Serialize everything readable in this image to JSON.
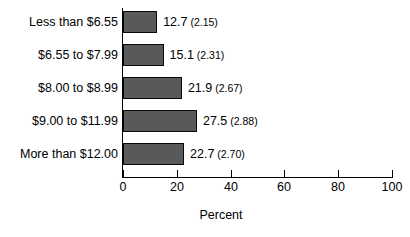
{
  "chart_data": {
    "type": "bar",
    "orientation": "horizontal",
    "title": "",
    "xlabel": "Percent",
    "ylabel": "",
    "xlim": [
      0,
      100
    ],
    "xticks": [
      "0",
      "20",
      "40",
      "60",
      "80",
      "100"
    ],
    "grid": false,
    "legend": null,
    "categories": [
      "Less than $6.55",
      "$6.55 to $7.99",
      "$8.00 to $8.99",
      "$9.00 to $11.99",
      "More than $12.00"
    ],
    "values": [
      12.7,
      15.1,
      21.9,
      27.5,
      22.7
    ],
    "standard_errors": [
      2.15,
      2.31,
      2.67,
      2.88,
      2.7
    ],
    "data_labels": [
      "12.7",
      "15.1",
      "21.9",
      "27.5",
      "22.7"
    ],
    "data_label_errors": [
      "(2.15)",
      "(2.31)",
      "(2.67)",
      "(2.88)",
      "(2.70)"
    ],
    "bar_fill_color": "#595959",
    "bar_border_color": "#0a0a0a",
    "axis_color": "#000000"
  }
}
